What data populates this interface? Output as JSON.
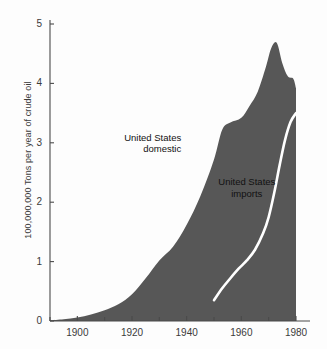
{
  "chart_data": {
    "type": "area",
    "title": "",
    "xlabel": "",
    "ylabel": "100,000,000 Tons per year of crude oil",
    "xlim": [
      1890,
      1980
    ],
    "ylim": [
      0,
      5
    ],
    "grid": false,
    "legend": "annotations-inline",
    "x_ticks_major": [
      1900,
      1920,
      1940,
      1960,
      1980
    ],
    "x_tick_labels": [
      "1900",
      "1920",
      "1940",
      "1960",
      "1980"
    ],
    "x_ticks_minor": [
      1890,
      1910,
      1930,
      1950,
      1970
    ],
    "y_ticks": [
      0,
      1,
      2,
      3,
      4,
      5
    ],
    "y_tick_labels": [
      "0",
      "1",
      "2",
      "3",
      "4",
      "5"
    ],
    "series": [
      {
        "name": "United States domestic",
        "render": "area",
        "color": "#575757",
        "x": [
          1890,
          1895,
          1900,
          1905,
          1910,
          1915,
          1920,
          1925,
          1930,
          1935,
          1940,
          1945,
          1950,
          1953,
          1956,
          1960,
          1963,
          1966,
          1969,
          1971,
          1973,
          1975,
          1977,
          1979,
          1980
        ],
        "values": [
          0.01,
          0.03,
          0.06,
          0.11,
          0.18,
          0.28,
          0.45,
          0.72,
          1.02,
          1.25,
          1.62,
          2.1,
          2.72,
          3.22,
          3.34,
          3.42,
          3.62,
          3.86,
          4.28,
          4.6,
          4.68,
          4.34,
          4.12,
          4.08,
          3.92
        ]
      },
      {
        "name": "United States imports",
        "render": "line",
        "color": "#ffffff",
        "x": [
          1950,
          1953,
          1956,
          1959,
          1962,
          1965,
          1968,
          1970,
          1972,
          1974,
          1976,
          1978,
          1980
        ],
        "values": [
          0.35,
          0.55,
          0.72,
          0.88,
          1.02,
          1.2,
          1.48,
          1.75,
          2.15,
          2.62,
          3.05,
          3.35,
          3.5
        ]
      }
    ],
    "annotations": [
      {
        "text_line1": "United States",
        "text_line2": "domestic",
        "x": 1938,
        "y": 3.05,
        "align": "right"
      },
      {
        "text_line1": "United States",
        "text_line2": "imports",
        "x": 1962,
        "y": 2.3,
        "align": "center"
      }
    ]
  },
  "axis": {
    "y_label": "100,000,000 Tons per year of crude oil",
    "y_tick_labels": [
      "0",
      "1",
      "2",
      "3",
      "4",
      "5"
    ],
    "x_tick_labels": [
      "1900",
      "1920",
      "1940",
      "1960",
      "1980"
    ]
  },
  "annotations": {
    "domestic_line1": "United States",
    "domestic_line2": "domestic",
    "imports_line1": "United States",
    "imports_line2": "imports"
  },
  "colors": {
    "area_fill": "#575757",
    "imports_line": "#ffffff",
    "axis": "#4a4a4a",
    "text": "#3b3b3b",
    "background": "#fdfdfd"
  }
}
